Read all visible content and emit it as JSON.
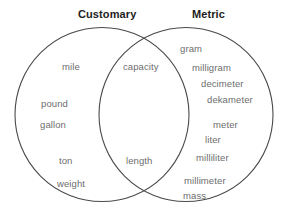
{
  "diagram": {
    "type": "venn-two-set",
    "background_color": "#ffffff",
    "stroke_color": "#4a4a4a",
    "title_color": "#1d1d1d",
    "term_color": "#6d6d6d",
    "left_set": {
      "title": "Customary",
      "title_x": 78,
      "title_y": 8,
      "circle": {
        "cx": 102,
        "cy": 114.5,
        "r": 87
      },
      "terms": [
        {
          "text": "mile",
          "x": 62,
          "y": 61
        },
        {
          "text": "pound",
          "x": 41,
          "y": 98
        },
        {
          "text": "gallon",
          "x": 40,
          "y": 119
        },
        {
          "text": "ton",
          "x": 59,
          "y": 155
        },
        {
          "text": "weight",
          "x": 57,
          "y": 178
        }
      ]
    },
    "right_set": {
      "title": "Metric",
      "title_x": 192,
      "title_y": 8,
      "circle": {
        "cx": 186,
        "cy": 114.5,
        "r": 87
      },
      "terms": [
        {
          "text": "gram",
          "x": 180,
          "y": 43
        },
        {
          "text": "milligram",
          "x": 192,
          "y": 62
        },
        {
          "text": "decimeter",
          "x": 201,
          "y": 78
        },
        {
          "text": "dekameter",
          "x": 207,
          "y": 94
        },
        {
          "text": "meter",
          "x": 213,
          "y": 119
        },
        {
          "text": "liter",
          "x": 205,
          "y": 134
        },
        {
          "text": "milliliter",
          "x": 196,
          "y": 152
        },
        {
          "text": "millimeter",
          "x": 184,
          "y": 175
        },
        {
          "text": "mass",
          "x": 183,
          "y": 190
        }
      ]
    },
    "intersection": {
      "terms": [
        {
          "text": "capacity",
          "x": 123,
          "y": 61
        },
        {
          "text": "length",
          "x": 126,
          "y": 155
        }
      ]
    }
  }
}
